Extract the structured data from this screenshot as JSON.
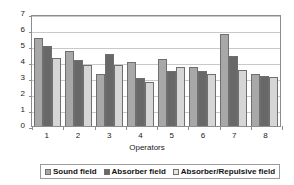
{
  "chart_data": {
    "type": "bar",
    "title": "",
    "subtitle": "",
    "xlabel": "Operators",
    "ylabel": "Time (s)",
    "categories": [
      "1",
      "2",
      "3",
      "4",
      "5",
      "6",
      "7",
      "8"
    ],
    "ylim": [
      0,
      7
    ],
    "yticks": [
      0,
      1,
      2,
      3,
      4,
      5,
      6,
      7
    ],
    "ytick_labels": [
      "0",
      "1",
      "2",
      "3",
      "4",
      "5",
      "6",
      "7"
    ],
    "grid": "horizontal",
    "legend_position": "bottom",
    "series": [
      {
        "name": "Sound field",
        "color": "#a8a8a8",
        "values": [
          5.5,
          4.7,
          3.25,
          4.0,
          4.2,
          3.7,
          5.75,
          3.25
        ]
      },
      {
        "name": "Absorber field",
        "color": "#686868",
        "values": [
          5.0,
          4.15,
          4.5,
          3.0,
          3.45,
          3.45,
          4.4,
          3.15
        ]
      },
      {
        "name": "Absorber/Repulsive field",
        "color": "#d6d6d6",
        "values": [
          4.25,
          3.8,
          3.8,
          2.75,
          3.7,
          3.25,
          3.5,
          3.05
        ]
      }
    ]
  },
  "axes": {
    "y_title": "Time (s)",
    "x_title": "Operators"
  },
  "legend": {
    "items": [
      {
        "label": "Sound field",
        "swatch": "legend-swatch-sound-field"
      },
      {
        "label": "Absorber field",
        "swatch": "legend-swatch-absorber-field"
      },
      {
        "label": "Absorber/Repulsive field",
        "swatch": "legend-swatch-absorber-repulsive-field"
      }
    ]
  }
}
